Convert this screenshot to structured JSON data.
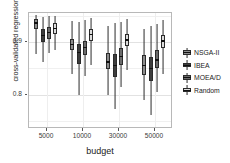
{
  "chart_data": {
    "type": "box",
    "title": "",
    "xlabel": "budget",
    "ylabel": "cross-validated regression accuracy",
    "categories": [
      "5000",
      "10000",
      "30000",
      "50000"
    ],
    "ylim": [
      0.735,
      0.955
    ],
    "yticks": [
      {
        "value": 0.9,
        "label": "0.9"
      },
      {
        "value": 0.8,
        "label": "0.8"
      }
    ],
    "yticks_minor": [
      0.95,
      0.85,
      0.75
    ],
    "grid": true,
    "legend_position": "right",
    "series": [
      {
        "name": "NSGA-II",
        "color": "#8c8c8c",
        "boxes": [
          {
            "category": "5000",
            "lower_whisker": 0.878,
            "q1": 0.925,
            "median": 0.936,
            "q3": 0.944,
            "upper_whisker": 0.952
          },
          {
            "category": "10000",
            "lower_whisker": 0.84,
            "q1": 0.884,
            "median": 0.895,
            "q3": 0.906,
            "upper_whisker": 0.94
          },
          {
            "category": "30000",
            "lower_whisker": 0.8,
            "q1": 0.848,
            "median": 0.862,
            "q3": 0.88,
            "upper_whisker": 0.93
          },
          {
            "category": "50000",
            "lower_whisker": 0.79,
            "q1": 0.838,
            "median": 0.856,
            "q3": 0.876,
            "upper_whisker": 0.925
          }
        ]
      },
      {
        "name": "IBEA",
        "color": "#3d3d3d",
        "boxes": [
          {
            "category": "5000",
            "lower_whisker": 0.862,
            "q1": 0.9,
            "median": 0.912,
            "q3": 0.924,
            "upper_whisker": 0.948
          },
          {
            "category": "10000",
            "lower_whisker": 0.8,
            "q1": 0.858,
            "median": 0.88,
            "q3": 0.896,
            "upper_whisker": 0.938
          },
          {
            "category": "30000",
            "lower_whisker": 0.772,
            "q1": 0.834,
            "median": 0.856,
            "q3": 0.878,
            "upper_whisker": 0.936
          },
          {
            "category": "50000",
            "lower_whisker": 0.762,
            "q1": 0.826,
            "median": 0.85,
            "q3": 0.872,
            "upper_whisker": 0.93
          }
        ]
      },
      {
        "name": "MOEA/D",
        "color": "#6b6b6b",
        "boxes": [
          {
            "category": "5000",
            "lower_whisker": 0.88,
            "q1": 0.906,
            "median": 0.918,
            "q3": 0.928,
            "upper_whisker": 0.95
          },
          {
            "category": "10000",
            "lower_whisker": 0.836,
            "q1": 0.876,
            "median": 0.89,
            "q3": 0.902,
            "upper_whisker": 0.942
          },
          {
            "category": "30000",
            "lower_whisker": 0.814,
            "q1": 0.856,
            "median": 0.872,
            "q3": 0.888,
            "upper_whisker": 0.938
          },
          {
            "category": "50000",
            "lower_whisker": 0.806,
            "q1": 0.85,
            "median": 0.866,
            "q3": 0.884,
            "upper_whisker": 0.934
          }
        ]
      },
      {
        "name": "Random",
        "color": "#dcdcdc",
        "boxes": [
          {
            "category": "5000",
            "lower_whisker": 0.884,
            "q1": 0.916,
            "median": 0.926,
            "q3": 0.936,
            "upper_whisker": 0.95
          },
          {
            "category": "10000",
            "lower_whisker": 0.856,
            "q1": 0.902,
            "median": 0.914,
            "q3": 0.924,
            "upper_whisker": 0.946
          },
          {
            "category": "30000",
            "lower_whisker": 0.846,
            "q1": 0.892,
            "median": 0.904,
            "q3": 0.916,
            "upper_whisker": 0.944
          },
          {
            "category": "50000",
            "lower_whisker": 0.84,
            "q1": 0.888,
            "median": 0.902,
            "q3": 0.914,
            "upper_whisker": 0.942
          }
        ]
      }
    ]
  },
  "legend": {
    "items": [
      {
        "label": "NSGA-II",
        "color": "#8c8c8c"
      },
      {
        "label": "IBEA",
        "color": "#3d3d3d"
      },
      {
        "label": "MOEA/D",
        "color": "#6b6b6b"
      },
      {
        "label": "Random",
        "color": "#dcdcdc"
      }
    ]
  }
}
